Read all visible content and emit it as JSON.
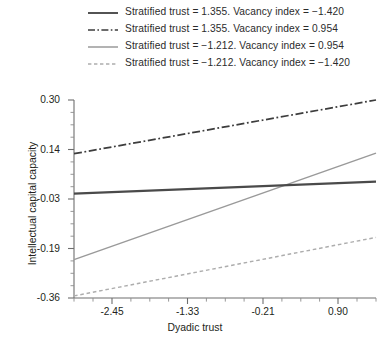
{
  "chart_data": {
    "type": "line",
    "title": "",
    "xlabel": "Dyadic trust",
    "ylabel": "Intellectual capital capacity",
    "xlim": [
      -3.01,
      1.46
    ],
    "ylim": [
      -0.36,
      0.3
    ],
    "grid": false,
    "legend_position": "top",
    "xticks": [
      "-2.45",
      "-1.33",
      "-0.21",
      "0.90"
    ],
    "xtick_values": [
      -2.45,
      -1.33,
      -0.21,
      0.9
    ],
    "yticks": [
      "0.30",
      "0.14",
      "-0.03",
      "-0.19",
      "-0.36"
    ],
    "ytick_values": [
      0.3,
      0.14,
      -0.03,
      -0.19,
      -0.36
    ],
    "minor_ticks_x": true,
    "series": [
      {
        "name": "Stratified trust = 1.355. Vacancy index = −1.420",
        "style": "solid",
        "color": "#4a4a4a",
        "width": 1.9,
        "x": [
          -3.01,
          1.46
        ],
        "y": [
          -0.012,
          0.028
        ]
      },
      {
        "name": "Stratified trust = 1.355. Vacancy index = 0.954",
        "style": "dashdot",
        "color": "#3d3d3d",
        "width": 1.5,
        "x": [
          -3.01,
          1.46
        ],
        "y": [
          0.121,
          0.3
        ]
      },
      {
        "name": "Stratified trust = −1.212. Vacancy index = 0.954",
        "style": "solid",
        "color": "#9a9a9a",
        "width": 1.4,
        "x": [
          -3.01,
          1.46
        ],
        "y": [
          -0.232,
          0.123
        ]
      },
      {
        "name": "Stratified trust = −1.212. Vacancy index = −1.420",
        "style": "dashed",
        "color": "#adadad",
        "width": 1.4,
        "x": [
          -3.01,
          1.46
        ],
        "y": [
          -0.353,
          -0.158
        ]
      }
    ]
  },
  "legend": {
    "items": [
      {
        "label": "Stratified trust = 1.355. Vacancy index = −1.420"
      },
      {
        "label": "Stratified trust = 1.355. Vacancy index = 0.954"
      },
      {
        "label": "Stratified trust = −1.212. Vacancy index = 0.954"
      },
      {
        "label": "Stratified trust = −1.212. Vacancy index = −1.420"
      }
    ]
  },
  "axes": {
    "y_title": "Intellectual capital capacity",
    "x_title": "Dyadic trust",
    "y_tick_labels": [
      "0.30",
      "0.14",
      "-0.03",
      "-0.19",
      "-0.36"
    ],
    "x_tick_labels": [
      "-2.45",
      "-1.33",
      "-0.21",
      "0.90"
    ]
  },
  "colors": {
    "axis": "#6e6e6e",
    "text": "#231f20",
    "series_dark": "#4a4a4a",
    "series_gray": "#9a9a9a",
    "series_light": "#adadad"
  }
}
